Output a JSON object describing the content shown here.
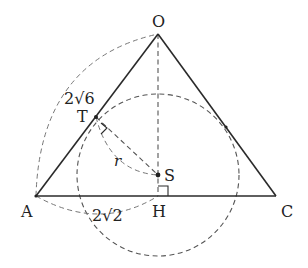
{
  "figure": {
    "type": "geometry",
    "points": {
      "O": {
        "label": "O",
        "x": 158,
        "y": 34
      },
      "A": {
        "label": "A",
        "x": 36,
        "y": 196
      },
      "C": {
        "label": "C",
        "x": 276,
        "y": 196
      },
      "H": {
        "label": "H",
        "x": 158,
        "y": 196
      },
      "S": {
        "label": "S",
        "x": 158,
        "y": 175
      },
      "T": {
        "label": "T",
        "x": 96,
        "y": 117
      }
    },
    "labels": {
      "O": "O",
      "A": "A",
      "C": "C",
      "H": "H",
      "S": "S",
      "T": "T",
      "radius": "r",
      "length_OT": "2√6",
      "length_AH": "2√2"
    },
    "length_annotations": [
      {
        "segment": "OT",
        "value": "2√6"
      },
      {
        "segment": "AH",
        "value": "2√2"
      }
    ],
    "circle": {
      "center": "S",
      "radius_label": "r",
      "radius_px": 81
    },
    "right_angles": [
      "OTS",
      "SHA"
    ],
    "colors": {
      "line": "#2a2a2a",
      "dashed": "#555555",
      "background": "#ffffff"
    }
  }
}
